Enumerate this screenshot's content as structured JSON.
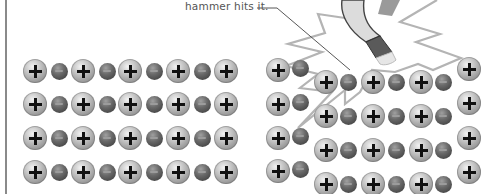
{
  "caption": "hammer hits it.",
  "colors": {
    "frame_line": "#8a8a8a",
    "burst_stroke": "#b4b4b4",
    "leader_line": "#444444",
    "positive_ion": "#c6c6c6",
    "negative_ion": "#555555",
    "hammer_head": "#d9d9d9",
    "hammer_band": "#5a5a5a"
  },
  "icons": {
    "positive_ion": "plus-sphere",
    "negative_ion": "minus-sphere",
    "hammer": "hammer",
    "impact_burst": "starburst"
  },
  "left_crystal": {
    "description": "intact ionic lattice",
    "rows": [
      [
        "+",
        "-",
        "+",
        "-",
        "+",
        "-",
        "+",
        "-",
        "+"
      ],
      [
        "+",
        "-",
        "+",
        "-",
        "+",
        "-",
        "+",
        "-",
        "+"
      ],
      [
        "+",
        "-",
        "+",
        "-",
        "+",
        "-",
        "+",
        "-",
        "+"
      ],
      [
        "+",
        "-",
        "+",
        "-",
        "+",
        "-",
        "+",
        "-",
        "+"
      ]
    ]
  },
  "right_crystal": {
    "description": "lattice after hammer strike, middle layer shifted so like charges align",
    "left_block_rows": [
      [
        "+",
        "-"
      ],
      [
        "+",
        "-"
      ],
      [
        "+",
        "-"
      ],
      [
        "+",
        "-"
      ]
    ],
    "shifted_block_rows": [
      [
        "+",
        "-",
        "+",
        "-",
        "+",
        "-"
      ],
      [
        "+",
        "-",
        "+",
        "-",
        "+",
        "-"
      ],
      [
        "+",
        "-",
        "+",
        "-",
        "+",
        "-"
      ],
      [
        "+",
        "-",
        "+",
        "-",
        "+",
        "-"
      ]
    ],
    "right_block_rows": [
      [
        "+"
      ],
      [
        "+"
      ],
      [
        "+"
      ],
      [
        "+"
      ]
    ]
  }
}
